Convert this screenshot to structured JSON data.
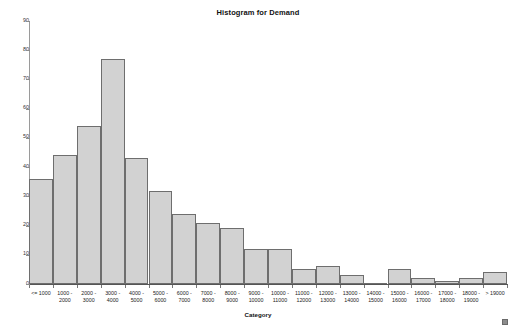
{
  "chart_data": {
    "type": "bar",
    "title": "Histogram for Demand",
    "xlabel": "Category",
    "ylabel": "",
    "ylim": [
      0,
      90
    ],
    "ytick_step": 10,
    "yticks": [
      90,
      80,
      70,
      60,
      50,
      40,
      30,
      20,
      10,
      0
    ],
    "grid": false,
    "legend": false,
    "bar_fill_color": "#d2d2d2",
    "bar_border_color": "#6e6e6e",
    "categories": [
      "<= 1000",
      "1000 - 2000",
      "2000 - 3000",
      "3000 - 4000",
      "4000 - 5000",
      "5000 - 6000",
      "6000 - 7000",
      "7000 - 8000",
      "8000 - 9000",
      "9000 - 10000",
      "10000 - 11000",
      "11000 - 12000",
      "12000 - 13000",
      "13000 - 14000",
      "14000 - 15000",
      "15000 - 16000",
      "16000 - 17000",
      "17000 - 18000",
      "18000 - 19000",
      "> 19000"
    ],
    "category_lines": [
      [
        "<= 1000",
        ""
      ],
      [
        "1000 -",
        "2000"
      ],
      [
        "2000 -",
        "3000"
      ],
      [
        "3000 -",
        "4000"
      ],
      [
        "4000 -",
        "5000"
      ],
      [
        "5000 -",
        "6000"
      ],
      [
        "6000 -",
        "7000"
      ],
      [
        "7000 -",
        "8000"
      ],
      [
        "8000 -",
        "9000"
      ],
      [
        "9000 -",
        "10000"
      ],
      [
        "10000 -",
        "11000"
      ],
      [
        "11000 -",
        "12000"
      ],
      [
        "12000 -",
        "13000"
      ],
      [
        "13000 -",
        "14000"
      ],
      [
        "14000 -",
        "15000"
      ],
      [
        "15000 -",
        "16000"
      ],
      [
        "16000 -",
        "17000"
      ],
      [
        "17000 -",
        "18000"
      ],
      [
        "18000 -",
        "19000"
      ],
      [
        "> 19000",
        ""
      ]
    ],
    "values": [
      36,
      44,
      54,
      77,
      43,
      32,
      24,
      21,
      19,
      12,
      12,
      5,
      6,
      3,
      0,
      5,
      2,
      1,
      2,
      4
    ]
  }
}
